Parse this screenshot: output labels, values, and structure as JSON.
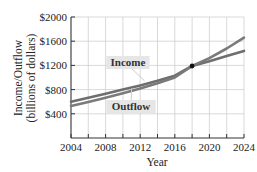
{
  "chart_data": {
    "type": "line",
    "title": "",
    "xlabel": "Year",
    "ylabel": "Income/Outflow",
    "ylabel_sub": "(billions of dollars)",
    "xlim": [
      2004,
      2024
    ],
    "ylim": [
      0,
      2000
    ],
    "x_ticks": [
      2004,
      2008,
      2012,
      2016,
      2020,
      2024
    ],
    "x_tick_labels": [
      "2004",
      "2008",
      "2012",
      "2016",
      "2020",
      "2024"
    ],
    "y_ticks": [
      400,
      800,
      1200,
      1600,
      2000
    ],
    "y_tick_labels": [
      "$400",
      "$800",
      "$1200",
      "$1600",
      "$2000"
    ],
    "grid": true,
    "legend": "inline labels",
    "x": [
      2004,
      2006,
      2008,
      2010,
      2012,
      2014,
      2016,
      2018,
      2020,
      2022,
      2024
    ],
    "series": [
      {
        "name": "Income",
        "label": "Income",
        "color": "#6e6e6e",
        "values": [
          600,
          665,
          730,
          800,
          870,
          945,
          1030,
          1190,
          1270,
          1355,
          1440
        ]
      },
      {
        "name": "Outflow",
        "label": "Outflow",
        "color": "#7a7a7a",
        "values": [
          530,
          595,
          665,
          740,
          820,
          905,
          1000,
          1190,
          1320,
          1480,
          1660
        ]
      }
    ],
    "annotations": [
      {
        "type": "point",
        "x": 2018,
        "y": 1190,
        "note": "intersection"
      }
    ]
  },
  "colors": {
    "grid": "#cfcfcf",
    "axis": "#333333",
    "label_bg": "#e6e6e6",
    "point": "#111111"
  }
}
